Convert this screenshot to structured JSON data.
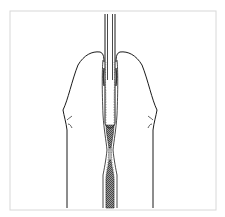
{
  "figure": {
    "type": "anatomical line illustration",
    "frame_color": "#d8d8d8",
    "line_color": "#1a1a1a",
    "fill_shading_color": "#7a7a7a",
    "background": "#ffffff"
  }
}
